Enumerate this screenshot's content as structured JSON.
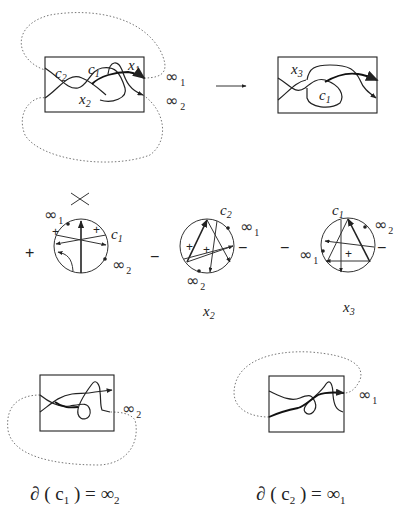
{
  "figure": {
    "top_left": {
      "labels": {
        "c2": "c",
        "c2_sub": "2",
        "c1": "c",
        "c1_sub": "1",
        "x1": "x",
        "x1_sub": "1",
        "x2": "x",
        "x2_sub": "2"
      },
      "infinity_1": {
        "symbol": "∞",
        "sub": "1"
      },
      "infinity_2": {
        "symbol": "∞",
        "sub": "2"
      }
    },
    "arrow": "→",
    "top_right": {
      "labels": {
        "x3": "x",
        "x3_sub": "3",
        "c1": "c",
        "c1_sub": "1"
      }
    },
    "gauss_diagrams": [
      {
        "sign": "+",
        "label": "c",
        "label_sub": "1",
        "inf_a": "∞",
        "inf_a_sub": "1",
        "inf_b": "∞",
        "inf_b_sub": "2",
        "crossing_signs": [
          "+",
          "+"
        ],
        "has_crossing_glyph": true
      },
      {
        "sign": "−",
        "label": "c",
        "label_sub": "2",
        "inf_a": "∞",
        "inf_a_sub": "1",
        "inf_b": "∞",
        "inf_b_sub": "2",
        "crossing_signs": [
          "+",
          "+"
        ],
        "side_sign": "−",
        "caption": "x",
        "caption_sub": "2"
      },
      {
        "sign": "−",
        "label": "c",
        "label_sub": "1",
        "inf_a": "∞",
        "inf_a_sub": "2",
        "inf_b": "∞",
        "inf_b_sub": "1",
        "crossing_signs": [
          "+"
        ],
        "side_sign": "−",
        "caption": "x",
        "caption_sub": "3"
      }
    ],
    "bottom_left": {
      "infinity": {
        "symbol": "∞",
        "sub": "2"
      },
      "equation": {
        "lhs": "∂ ( c",
        "lhs_sub": "1",
        "rhs": " ) = ∞",
        "rhs_sub": "2"
      }
    },
    "bottom_right": {
      "infinity": {
        "symbol": "∞",
        "sub": "1"
      },
      "equation": {
        "lhs": "∂ ( c",
        "lhs_sub": "2",
        "rhs": " ) = ∞",
        "rhs_sub": "1"
      }
    }
  }
}
